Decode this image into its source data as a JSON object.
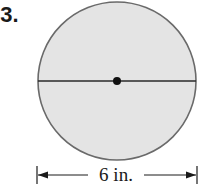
{
  "problem_number": "33.",
  "figure": {
    "shape": "circle",
    "fill_color": "#e4e4e4",
    "stroke_color": "#6a6a6a",
    "diameter_line": true,
    "center_dot": true
  },
  "dimension": {
    "label": "6 in."
  }
}
